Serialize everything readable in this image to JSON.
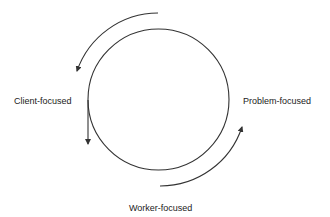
{
  "diagram": {
    "labels": {
      "left": "Client-focused",
      "right": "Problem-focused",
      "bottom": "Worker-focused"
    },
    "elements": {
      "circle": "central-circle",
      "arrows": [
        "outer-top-arc-arrow-counterclockwise",
        "left-vertical-arrow-down",
        "outer-bottom-right-arc-arrow-upward"
      ]
    },
    "colors": {
      "stroke": "#333333",
      "text": "#222222",
      "background": "#ffffff"
    }
  }
}
